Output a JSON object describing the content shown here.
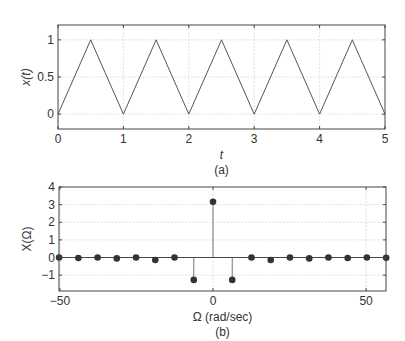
{
  "chart_data": [
    {
      "type": "line",
      "panel_label": "(a)",
      "title": "",
      "xlabel": "t",
      "ylabel": "x(t)",
      "xlim": [
        0,
        5
      ],
      "ylim": [
        -0.2,
        1.2
      ],
      "xticks": [
        0,
        1,
        2,
        3,
        4,
        5
      ],
      "yticks": [
        0,
        0.5,
        1
      ],
      "xtick_labels": [
        "0",
        "1",
        "2",
        "3",
        "4",
        "5"
      ],
      "ytick_labels": [
        "0",
        "0.5",
        "1"
      ],
      "grid": true,
      "series": [
        {
          "name": "x(t)",
          "x": [
            0,
            0.5,
            1,
            1.5,
            2,
            2.5,
            3,
            3.5,
            4,
            4.5,
            5
          ],
          "y": [
            0,
            1,
            0,
            1,
            0,
            1,
            0,
            1,
            0,
            1,
            0
          ]
        }
      ]
    },
    {
      "type": "stem",
      "panel_label": "(b)",
      "title": "",
      "xlabel": "Ω (rad/sec)",
      "ylabel": "X(Ω)",
      "xlim": [
        -50.3,
        56.5
      ],
      "ylim": [
        -1.9,
        4
      ],
      "xticks": [
        -50,
        0,
        50
      ],
      "yticks": [
        -1,
        0,
        1,
        2,
        3,
        4
      ],
      "xtick_labels": [
        "−50",
        "0",
        "50"
      ],
      "ytick_labels": [
        "−1",
        "0",
        "1",
        "2",
        "3",
        "4"
      ],
      "grid": true,
      "series": [
        {
          "name": "X(Ω)",
          "x": [
            -50.27,
            -43.98,
            -37.7,
            -31.42,
            -25.13,
            -18.85,
            -12.57,
            -6.28,
            0,
            6.28,
            12.57,
            18.85,
            25.13,
            31.42,
            37.7,
            43.98,
            50.27,
            56.55
          ],
          "y": [
            0,
            -0.03,
            0,
            -0.05,
            0,
            -0.14,
            0,
            -1.27,
            3.16,
            -1.27,
            0,
            -0.14,
            0,
            -0.05,
            0,
            -0.03,
            0,
            -0.02
          ]
        }
      ]
    }
  ]
}
